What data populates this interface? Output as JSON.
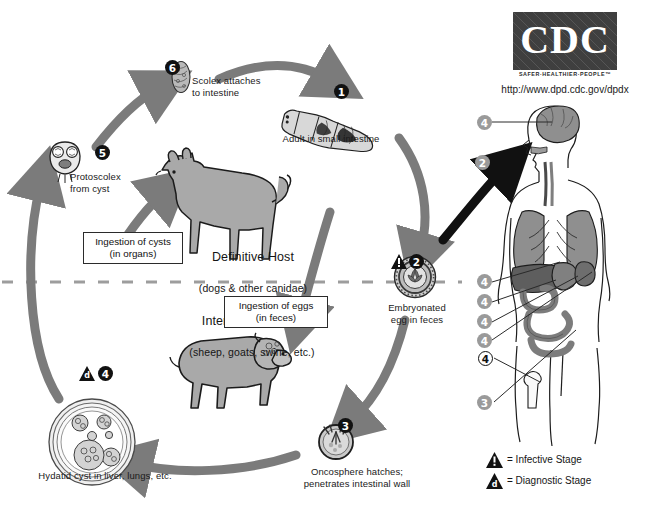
{
  "diagram": {
    "source_logo": "CDC",
    "logo_tagline": "SAFER·HEALTHIER·PEOPLE™",
    "url": "http://www.dpd.cdc.gov/dpdx"
  },
  "steps": [
    {
      "id": "1",
      "number": "1",
      "marker": "dark",
      "label": "Adult in small intestine"
    },
    {
      "id": "2",
      "number": "2",
      "marker": "dark",
      "stage": "infective",
      "label": "Embryonated\negg in feces"
    },
    {
      "id": "3",
      "number": "3",
      "marker": "dark",
      "label": "Oncosphere hatches;\npenetrates intestinal wall"
    },
    {
      "id": "4",
      "number": "4",
      "marker": "dark",
      "stage": "diagnostic",
      "label": "Hydatid cyst in liver, lungs, etc."
    },
    {
      "id": "5",
      "number": "5",
      "marker": "dark",
      "label": "Protoscolex\nfrom cyst"
    },
    {
      "id": "6",
      "number": "6",
      "marker": "dark",
      "label": "Scolex attaches\nto intestine"
    }
  ],
  "hosts": {
    "definitive": {
      "title": "Definitive Host",
      "subtitle": "(dogs & other canidae)"
    },
    "intermediate": {
      "title": "Intermediate Host",
      "subtitle": "(sheep, goats, swine, etc.)"
    }
  },
  "boxed_captions": [
    {
      "id": "ingestion-cysts",
      "text": "Ingestion of cysts\n(in organs)"
    },
    {
      "id": "ingestion-eggs",
      "text": "Ingestion of eggs\n(in feces)"
    }
  ],
  "human_markers": [
    {
      "number": "4",
      "style": "gray",
      "organ": "brain"
    },
    {
      "number": "2",
      "style": "gray",
      "organ": "ingestion-route"
    },
    {
      "number": "4",
      "style": "gray",
      "organ": "lung"
    },
    {
      "number": "4",
      "style": "gray",
      "organ": "liver"
    },
    {
      "number": "4",
      "style": "gray",
      "organ": "spleen"
    },
    {
      "number": "4",
      "style": "gray",
      "organ": "kidney"
    },
    {
      "number": "4",
      "style": "open",
      "organ": "bone"
    },
    {
      "number": "3",
      "style": "gray",
      "organ": "intestine"
    }
  ],
  "legend": [
    {
      "symbol": "infective",
      "glyph": "!",
      "text": "= Infective Stage"
    },
    {
      "symbol": "diagnostic",
      "glyph": "d",
      "text": "= Diagnostic Stage"
    }
  ],
  "colors": {
    "arrow_gray": "#7b7b7b",
    "organ_gray": "#8f8f8f",
    "animal_gray": "#a6a6a6",
    "black": "#111111",
    "marker_gray": "#9a9a9a"
  }
}
